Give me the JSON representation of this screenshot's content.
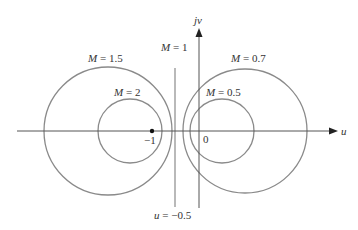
{
  "figure": {
    "type": "constant-magnitude circles (M-circles) in the complex plane",
    "axes": {
      "real_label": "u",
      "imag_label": "jv",
      "origin_label": "0",
      "critical_point_label": "−1"
    },
    "circles": [
      {
        "id": "m-1-5",
        "label": "M = 1.5",
        "side": "left"
      },
      {
        "id": "m-2",
        "label": "M = 2",
        "side": "left"
      },
      {
        "id": "m-0-7",
        "label": "M = 0.7",
        "side": "right"
      },
      {
        "id": "m-0-5",
        "label": "M = 0.5",
        "side": "right"
      }
    ],
    "line": {
      "top_label": "M = 1",
      "bottom_label": "u = −0.5"
    }
  },
  "colors": {
    "curve": "#8a8a8a",
    "axis": "#555555",
    "text": "#333333",
    "point": "#111111"
  }
}
